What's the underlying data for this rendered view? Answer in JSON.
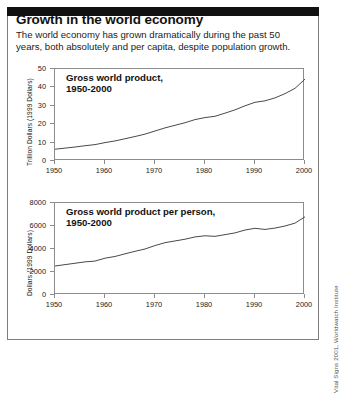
{
  "header": {
    "title": "Growth in the world economy",
    "subtitle": "The world economy has grown dramatically during the past 50 years, both absolutely and per capita, despite population growth."
  },
  "credit": "Vital Signs 2001, Worldwatch Institute",
  "colors": {
    "banner": "#111111",
    "border": "#7d7d7d",
    "axis": "#8c8c8c",
    "line": "#4a4a4a",
    "text": "#111111"
  },
  "chart_data": [
    {
      "type": "line",
      "title": "Gross world product, 1950-2000",
      "title_line1": "Gross world product,",
      "title_line2": "1950-2000",
      "xlabel": "",
      "ylabel": "Trillion Dollars (1999 Dollars)",
      "xlim": [
        1950,
        2000
      ],
      "ylim": [
        0,
        50
      ],
      "xticks": [
        1950,
        1960,
        1970,
        1980,
        1990,
        2000
      ],
      "yticks": [
        0,
        10,
        20,
        30,
        40,
        50
      ],
      "grid": false,
      "legend": "none",
      "x": [
        1950,
        1952,
        1954,
        1956,
        1958,
        1960,
        1962,
        1964,
        1966,
        1968,
        1970,
        1972,
        1974,
        1976,
        1978,
        1980,
        1982,
        1984,
        1986,
        1988,
        1990,
        1992,
        1994,
        1996,
        1998,
        2000
      ],
      "values": [
        6.4,
        7.0,
        7.6,
        8.3,
        8.9,
        10.0,
        10.9,
        12.1,
        13.3,
        14.6,
        16.3,
        18.0,
        19.4,
        20.8,
        22.5,
        23.6,
        24.3,
        26.0,
        27.8,
        30.0,
        31.9,
        32.7,
        34.3,
        36.6,
        39.5,
        44.5
      ]
    },
    {
      "type": "line",
      "title": "Gross world product per person, 1950-2000",
      "title_line1": "Gross world product per person,",
      "title_line2": "1950-2000",
      "xlabel": "",
      "ylabel": "Dollars (1999 Dollars)",
      "xlim": [
        1950,
        2000
      ],
      "ylim": [
        0,
        8000
      ],
      "xticks": [
        1950,
        1960,
        1970,
        1980,
        1990,
        2000
      ],
      "yticks": [
        0,
        2000,
        4000,
        6000,
        8000
      ],
      "grid": false,
      "legend": "none",
      "x": [
        1950,
        1952,
        1954,
        1956,
        1958,
        1960,
        1962,
        1964,
        1966,
        1968,
        1970,
        1972,
        1974,
        1976,
        1978,
        1980,
        1982,
        1984,
        1986,
        1988,
        1990,
        1992,
        1994,
        1996,
        1998,
        2000
      ],
      "values": [
        2520,
        2640,
        2760,
        2880,
        2950,
        3200,
        3350,
        3580,
        3800,
        4000,
        4300,
        4550,
        4700,
        4850,
        5050,
        5150,
        5100,
        5250,
        5400,
        5650,
        5800,
        5700,
        5820,
        6000,
        6250,
        6800
      ]
    }
  ],
  "panels": [
    {
      "key": "panel-gross-world-product"
    },
    {
      "key": "panel-gross-world-product-per-person"
    }
  ]
}
